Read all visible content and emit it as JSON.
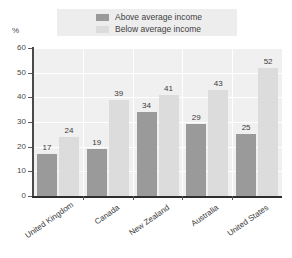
{
  "chart_data": {
    "type": "bar",
    "title": "",
    "xlabel": "",
    "ylabel": "%",
    "ylim": [
      0,
      60
    ],
    "yticks": [
      0,
      10,
      20,
      30,
      40,
      50,
      60
    ],
    "grid": true,
    "legend_position": "top",
    "categories": [
      "United Kingdom",
      "Canada",
      "New Zealand",
      "Australia",
      "United States"
    ],
    "series": [
      {
        "name": "Above average income",
        "color": "#9a9a9a",
        "values": [
          17,
          19,
          34,
          29,
          25
        ]
      },
      {
        "name": "Below average income",
        "color": "#dcdcdc",
        "values": [
          24,
          39,
          41,
          43,
          52
        ]
      }
    ]
  },
  "axis": {
    "unit_label": "%",
    "tick_labels": [
      "60",
      "50",
      "40",
      "30",
      "20",
      "10",
      "0"
    ]
  },
  "legend": {
    "entries": [
      {
        "label": "Above average income",
        "color": "#9a9a9a"
      },
      {
        "label": "Below average income",
        "color": "#dcdcdc"
      }
    ]
  },
  "title_strip": {
    "text": ""
  }
}
